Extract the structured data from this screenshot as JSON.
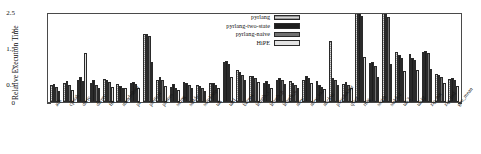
{
  "chart_data": {
    "type": "bar",
    "title": "",
    "xlabel": "",
    "ylabel": "Relative Execution Time",
    "ylim": [
      0,
      2.5
    ],
    "yticks": [
      "0",
      "0.5",
      "1",
      "1.5",
      "2",
      "2.5"
    ],
    "grid": false,
    "legend_position": "top-center",
    "categories": [
      "ack",
      "cpstak",
      "deriv",
      "divrec",
      "fib",
      "mandelbrot",
      "pi",
      "prettypr",
      "primes",
      "string",
      "stable",
      "sum1oop",
      "tak",
      "takl",
      "barnes",
      "length_c",
      "length_p",
      "length_u",
      "nrev",
      "nrev_ind",
      "nucleic",
      "pseudoknot",
      "qsort",
      "ring",
      "smith",
      "stable2",
      "tak2",
      "takl2",
      "zip_nat",
      "zip_ind",
      "geo_mean"
    ],
    "series": [
      {
        "name": "pyrlang",
        "color": "#9a9a9a",
        "values": [
          0.48,
          0.52,
          0.62,
          0.52,
          0.63,
          0.5,
          0.52,
          1.88,
          0.62,
          0.42,
          0.55,
          0.48,
          0.53,
          1.1,
          0.88,
          0.72,
          0.52,
          0.62,
          0.58,
          0.6,
          0.58,
          1.7,
          0.5,
          2.5,
          1.08,
          2.5,
          1.4,
          1.33,
          1.4,
          0.78,
          0.64
        ]
      },
      {
        "name": "pyrlang-two-state",
        "color": "#1d1d1d",
        "values": [
          0.5,
          0.58,
          0.7,
          0.6,
          0.6,
          0.45,
          0.55,
          1.9,
          0.7,
          0.5,
          0.52,
          0.44,
          0.52,
          1.15,
          0.82,
          0.72,
          0.58,
          0.68,
          0.52,
          0.72,
          0.46,
          0.68,
          0.55,
          2.5,
          1.12,
          2.5,
          1.3,
          1.22,
          1.42,
          0.74,
          0.66
        ]
      },
      {
        "name": "pyrlang-naive",
        "color": "#717171",
        "values": [
          0.42,
          0.46,
          0.58,
          0.48,
          0.55,
          0.4,
          0.5,
          1.82,
          0.6,
          0.4,
          0.48,
          0.38,
          0.48,
          1.05,
          0.76,
          0.66,
          0.5,
          0.6,
          0.48,
          0.66,
          0.42,
          0.62,
          0.48,
          2.4,
          1.0,
          2.35,
          1.22,
          1.16,
          1.35,
          0.7,
          0.62
        ]
      },
      {
        "name": "HiPE",
        "color": "#e2e2e2",
        "values": [
          0.3,
          0.34,
          1.35,
          0.4,
          0.42,
          0.38,
          0.4,
          1.1,
          0.45,
          0.32,
          0.4,
          0.3,
          0.38,
          0.7,
          0.6,
          0.56,
          0.38,
          0.5,
          0.4,
          0.52,
          0.36,
          0.46,
          0.4,
          1.25,
          0.7,
          1.05,
          0.86,
          0.9,
          0.92,
          0.52,
          0.44
        ]
      }
    ]
  },
  "legend": {
    "items": [
      {
        "label": "pyrlang"
      },
      {
        "label": "pyrlang-two-state"
      },
      {
        "label": "pyrlang-naive"
      },
      {
        "label": "HiPE"
      }
    ]
  }
}
